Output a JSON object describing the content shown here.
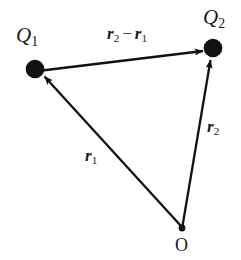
{
  "figure": {
    "kind": "vector-diagram",
    "background_color": "#ffffff",
    "stroke_color": "#111111"
  },
  "labels": {
    "charge1": {
      "symbol": "Q",
      "subscript": "1"
    },
    "charge2": {
      "symbol": "Q",
      "subscript": "2"
    },
    "origin": {
      "text": "O"
    },
    "vector_r1": {
      "symbol": "r",
      "subscript": "1"
    },
    "vector_r2": {
      "symbol": "r",
      "subscript": "2"
    },
    "vector_separation": {
      "first_symbol": "r",
      "first_subscript": "2",
      "operator": "−",
      "second_symbol": "r",
      "second_subscript": "1"
    }
  },
  "geometry": {
    "points": {
      "Q1": {
        "x": 35,
        "y": 69,
        "radius": 9
      },
      "Q2": {
        "x": 213,
        "y": 48,
        "radius": 9
      },
      "O": {
        "x": 182,
        "y": 228,
        "radius": 3
      }
    },
    "arrows": [
      {
        "name": "r1",
        "from": "O",
        "to": "Q1"
      },
      {
        "name": "r2",
        "from": "O",
        "to": "Q2"
      },
      {
        "name": "r2-minus-r1",
        "from": "Q1",
        "to": "Q2"
      }
    ],
    "line_width": 2.2
  }
}
